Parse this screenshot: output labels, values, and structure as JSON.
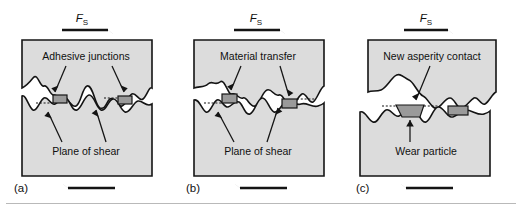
{
  "figure": {
    "colors": {
      "body_fill": "#dcdcdc",
      "patch_fill": "#9a9a9a",
      "line": "#141414",
      "background": "#ffffff",
      "rule": "#b9b9b9"
    }
  },
  "panels": [
    {
      "id": "a",
      "panel_label": "(a)",
      "force_symbol": "F",
      "force_subscript": "S",
      "top_arrow_direction": "right",
      "bottom_arrow_direction": "left",
      "labels": [
        {
          "text": "Adhesive junctions",
          "role": "upper-callout"
        },
        {
          "text": "Plane of shear",
          "role": "lower-callout"
        }
      ],
      "junction_count": 2
    },
    {
      "id": "b",
      "panel_label": "(b)",
      "force_symbol": "F",
      "force_subscript": "S",
      "top_arrow_direction": "right",
      "bottom_arrow_direction": "left",
      "labels": [
        {
          "text": "Material transfer",
          "role": "upper-callout"
        },
        {
          "text": "Plane of shear",
          "role": "lower-callout"
        }
      ],
      "junction_count": 2
    },
    {
      "id": "c",
      "panel_label": "(c)",
      "force_symbol": "F",
      "force_subscript": "S",
      "top_arrow_direction": "right",
      "bottom_arrow_direction": "left",
      "labels": [
        {
          "text": "New asperity contact",
          "role": "upper-callout"
        },
        {
          "text": "Wear particle",
          "role": "lower-callout"
        }
      ],
      "junction_count": 2
    }
  ]
}
